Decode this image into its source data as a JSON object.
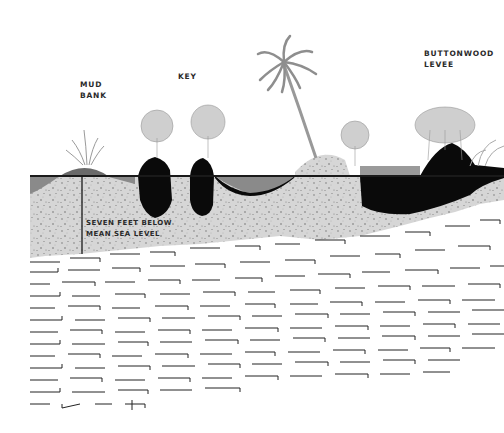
{
  "diagram": {
    "type": "geological cross-section",
    "labels": {
      "mud_bank": "MUD\nBANK",
      "key": "KEY",
      "buttonwood_levee": "BUTTONWOOD\nLEVEE",
      "depth_note": "SEVEN FEET BELOW\nMEAN SEA LEVEL"
    },
    "layers": [
      {
        "name": "water",
        "color": "#8c8c8c"
      },
      {
        "name": "mud / peat",
        "color": "#0a0a0a"
      },
      {
        "name": "lime sediment",
        "color": "#d6d6d6"
      },
      {
        "name": "limestone bedrock",
        "color": "#ffffff"
      }
    ],
    "colors": {
      "sea_level_line": "#1a1a1a",
      "vegetation": "#9a9a9a",
      "sediment": "#d4d4d4",
      "peat": "#0a0a0a",
      "water": "#8a8a8a"
    }
  }
}
